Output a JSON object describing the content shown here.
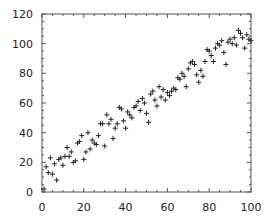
{
  "chart_data": {
    "type": "scatter",
    "title": "",
    "xlabel": "",
    "ylabel": "",
    "xlim": [
      0,
      100
    ],
    "ylim": [
      0,
      120
    ],
    "xticks": [
      0,
      20,
      40,
      60,
      80,
      100
    ],
    "yticks": [
      0,
      20,
      40,
      60,
      80,
      100,
      120
    ],
    "xtick_labels": [
      "0",
      "20",
      "40",
      "60",
      "80",
      "100"
    ],
    "ytick_labels": [
      "0",
      "20",
      "40",
      "60",
      "80",
      "100",
      "120"
    ],
    "grid": false,
    "legend": null,
    "marker": "+",
    "marker_color": "#222222",
    "frame_color": "#555555",
    "series": [
      {
        "name": "data",
        "points": [
          [
            1,
            2
          ],
          [
            2,
            17
          ],
          [
            3,
            13
          ],
          [
            4,
            23
          ],
          [
            5,
            12
          ],
          [
            6,
            19
          ],
          [
            7,
            8
          ],
          [
            8,
            22
          ],
          [
            9,
            23
          ],
          [
            10,
            18
          ],
          [
            11,
            24
          ],
          [
            12,
            30
          ],
          [
            13,
            24
          ],
          [
            14,
            27
          ],
          [
            15,
            20
          ],
          [
            16,
            21
          ],
          [
            17,
            33
          ],
          [
            18,
            34
          ],
          [
            19,
            38
          ],
          [
            20,
            22
          ],
          [
            21,
            27
          ],
          [
            22,
            40
          ],
          [
            23,
            29
          ],
          [
            24,
            35
          ],
          [
            25,
            33
          ],
          [
            26,
            32
          ],
          [
            27,
            38
          ],
          [
            28,
            46
          ],
          [
            29,
            46
          ],
          [
            30,
            31
          ],
          [
            31,
            52
          ],
          [
            32,
            46
          ],
          [
            33,
            49
          ],
          [
            34,
            36
          ],
          [
            35,
            43
          ],
          [
            36,
            46
          ],
          [
            37,
            57
          ],
          [
            38,
            56
          ],
          [
            39,
            48
          ],
          [
            40,
            43
          ],
          [
            41,
            54
          ],
          [
            42,
            52
          ],
          [
            43,
            50
          ],
          [
            44,
            57
          ],
          [
            45,
            58
          ],
          [
            46,
            61
          ],
          [
            47,
            55
          ],
          [
            48,
            63
          ],
          [
            49,
            60
          ],
          [
            50,
            53
          ],
          [
            51,
            47
          ],
          [
            52,
            66
          ],
          [
            53,
            68
          ],
          [
            54,
            62
          ],
          [
            55,
            58
          ],
          [
            56,
            71
          ],
          [
            57,
            64
          ],
          [
            58,
            69
          ],
          [
            59,
            62
          ],
          [
            60,
            67
          ],
          [
            61,
            65
          ],
          [
            62,
            68
          ],
          [
            63,
            70
          ],
          [
            64,
            69
          ],
          [
            65,
            77
          ],
          [
            66,
            76
          ],
          [
            67,
            80
          ],
          [
            68,
            78
          ],
          [
            69,
            71
          ],
          [
            70,
            83
          ],
          [
            71,
            87
          ],
          [
            72,
            88
          ],
          [
            73,
            86
          ],
          [
            74,
            79
          ],
          [
            75,
            74
          ],
          [
            76,
            82
          ],
          [
            77,
            78
          ],
          [
            78,
            88
          ],
          [
            79,
            96
          ],
          [
            80,
            95
          ],
          [
            81,
            92
          ],
          [
            82,
            88
          ],
          [
            83,
            97
          ],
          [
            84,
            100
          ],
          [
            85,
            99
          ],
          [
            86,
            102
          ],
          [
            87,
            94
          ],
          [
            88,
            86
          ],
          [
            89,
            101
          ],
          [
            90,
            103
          ],
          [
            91,
            100
          ],
          [
            92,
            104
          ],
          [
            93,
            99
          ],
          [
            94,
            109
          ],
          [
            95,
            107
          ],
          [
            96,
            104
          ],
          [
            97,
            97
          ],
          [
            98,
            106
          ],
          [
            99,
            103
          ],
          [
            100,
            102
          ]
        ]
      }
    ]
  }
}
